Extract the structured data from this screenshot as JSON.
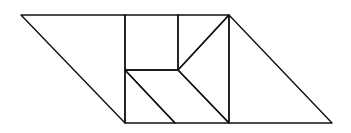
{
  "diagram": {
    "title": "",
    "stroke_color": "#111111",
    "background": "#ffffff",
    "shapes": [
      {
        "name": "left-large-triangle",
        "points": "21,15 125,15 125,123"
      },
      {
        "name": "square",
        "points": "125,15 178,15 178,70 125,70"
      },
      {
        "name": "small-triangle-top-right",
        "points": "178,15 229,15 178,70"
      },
      {
        "name": "medium-triangle-right",
        "points": "229,15 229,123 178,70"
      },
      {
        "name": "small-triangle-bottom-left",
        "points": "125,70 175,123 125,123"
      },
      {
        "name": "parallelogram",
        "points": "125,70 178,70 229,123 175,123"
      },
      {
        "name": "right-large-triangle",
        "points": "229,15 332,123 229,123"
      }
    ]
  }
}
